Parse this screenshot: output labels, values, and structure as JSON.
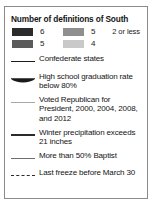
{
  "legend": {
    "title": "Number of definitions of South",
    "classes": [
      {
        "label": "6",
        "color": "#2b2b2b",
        "position": "col1-row1"
      },
      {
        "label": "5",
        "color": "#8f8f8f",
        "position": "col2-row1"
      },
      {
        "label": "5",
        "color": "#5b5b5b",
        "position": "col1-row2"
      },
      {
        "label": "4",
        "color": "#c9c9c9",
        "position": "col2-row2"
      }
    ],
    "no_swatch_label": "2 or less",
    "entries": [
      {
        "symbol": "solid-line-dark",
        "text": "Confederate states"
      },
      {
        "symbol": "tapered-lens-black",
        "text": "High school  graduation rate below 80%"
      },
      {
        "symbol": "solid-line-light-gray",
        "text": "Voted Republican for President, 2000, 2004, 2008, and 2012"
      },
      {
        "symbol": "solid-line-dark-thick",
        "text": "Winter precipitation exceeds 21 inches"
      },
      {
        "symbol": "solid-line-medium-gray",
        "text": "More than 50% Baptist"
      },
      {
        "symbol": "dashed-line-dark",
        "text": "Last freeze before March 30"
      }
    ]
  }
}
